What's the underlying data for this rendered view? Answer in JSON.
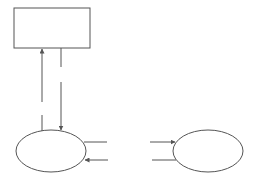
{
  "diagram": {
    "background": "#ffffff",
    "stroke_color": "#555555",
    "nodes": [
      {
        "id": "rect",
        "shape": "rectangle",
        "x": 14,
        "y": 8,
        "width": 76,
        "height": 40,
        "label": ""
      },
      {
        "id": "ellipse-left",
        "shape": "ellipse",
        "cx": 51,
        "cy": 151,
        "rx": 35,
        "ry": 21,
        "label": ""
      },
      {
        "id": "ellipse-right",
        "shape": "ellipse",
        "cx": 208,
        "cy": 151,
        "rx": 35,
        "ry": 21,
        "label": ""
      }
    ],
    "edges": [
      {
        "id": "up-arrow",
        "from": "ellipse-left",
        "to": "rect",
        "style": "broken",
        "direction": "up"
      },
      {
        "id": "down-arrow",
        "from": "rect",
        "to": "ellipse-left",
        "style": "broken",
        "direction": "down"
      },
      {
        "id": "left-upper-stub",
        "from": "ellipse-left",
        "to": "",
        "direction": "none"
      },
      {
        "id": "left-lower-arrow",
        "from": "",
        "to": "ellipse-left",
        "direction": "left"
      },
      {
        "id": "right-upper-arrow",
        "from": "",
        "to": "ellipse-right",
        "direction": "right"
      },
      {
        "id": "right-lower-stub",
        "from": "ellipse-right",
        "to": "",
        "direction": "none"
      }
    ]
  }
}
